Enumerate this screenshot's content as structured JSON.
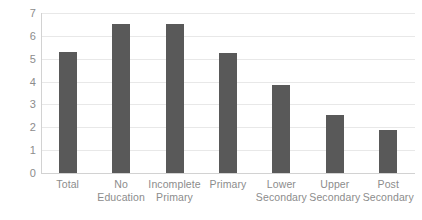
{
  "chart_data": {
    "type": "bar",
    "title": "",
    "xlabel": "",
    "ylabel": "",
    "categories": [
      "Total",
      "No Education",
      "Incomplete Primary",
      "Primary",
      "Lower Secondary",
      "Upper Secondary",
      "Post Secondary"
    ],
    "category_lines": [
      [
        "Total"
      ],
      [
        "No",
        "Education"
      ],
      [
        "Incomplete",
        "Primary"
      ],
      [
        "Primary"
      ],
      [
        "Lower",
        "Secondary"
      ],
      [
        "Upper",
        "Secondary"
      ],
      [
        "Post",
        "Secondary"
      ]
    ],
    "values": [
      5.3,
      6.5,
      6.5,
      5.25,
      3.85,
      2.55,
      1.9
    ],
    "ylim": [
      0,
      7
    ],
    "yticks": [
      0,
      1,
      2,
      3,
      4,
      5,
      6,
      7
    ],
    "ytick_labels": [
      "0",
      "1",
      "2",
      "3",
      "4",
      "5",
      "6",
      "7"
    ],
    "grid": true,
    "legend": "none",
    "series": [
      {
        "name": "",
        "values": [
          5.3,
          6.5,
          6.5,
          5.25,
          3.85,
          2.55,
          1.9
        ]
      }
    ]
  },
  "style": {
    "bar_color": "#595959",
    "gridline_color": "#e8e8e8",
    "axis_color": "#d2d2d2",
    "tick_label_color": "#8c8c8c",
    "background": "#ffffff"
  }
}
